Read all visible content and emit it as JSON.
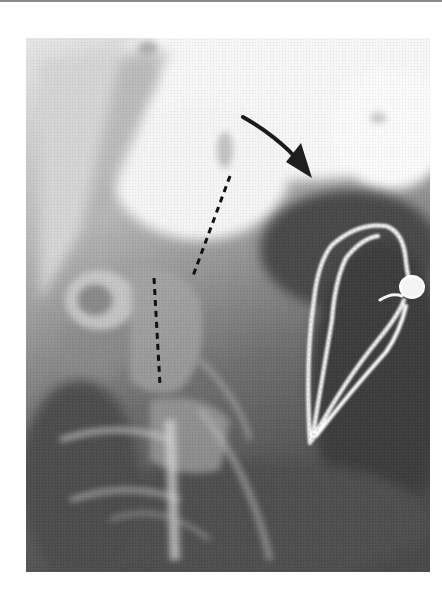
{
  "figure": {
    "kind": "lateral cervical spine radiograph",
    "colors": {
      "page_background": "#ffffff",
      "top_rule": "#8a8a8a",
      "bright_bone": "#f4f4f4",
      "soft_tissue": "#9a9a9a",
      "dark_air": "#3e3e3e",
      "annotation": "#1a1a1a",
      "wire": "#f2f2f2"
    },
    "annotations": {
      "arrow": {
        "icon": "curved-arrow-icon",
        "from": [
          242,
          116
        ],
        "to": [
          312,
          178
        ]
      },
      "dashed_line_upper": {
        "from": [
          230,
          176
        ],
        "to": [
          193,
          276
        ]
      },
      "dashed_line_lower": {
        "from": [
          154,
          277
        ],
        "to": [
          160,
          385
        ]
      },
      "wire_loop": {
        "icon": "surgical-wire-loop",
        "apex_bottom": [
          310,
          443
        ],
        "knot": [
          410,
          285
        ]
      }
    }
  }
}
